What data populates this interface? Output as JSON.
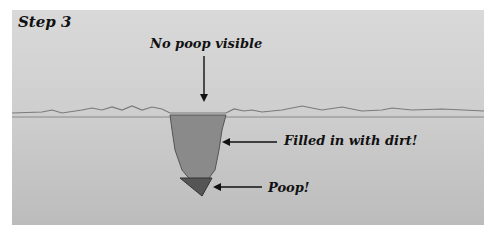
{
  "diagram": {
    "step_label": "Step 3",
    "labels": {
      "top": "No poop visible",
      "dirt": "Filled in with dirt!",
      "poop": "Poop!"
    },
    "colors": {
      "background": "#d2d2d2",
      "ground_line": "#7a7a7a",
      "dirt_fill": "#8a8a8a",
      "poop_fill": "#555555",
      "text": "#111111"
    }
  }
}
